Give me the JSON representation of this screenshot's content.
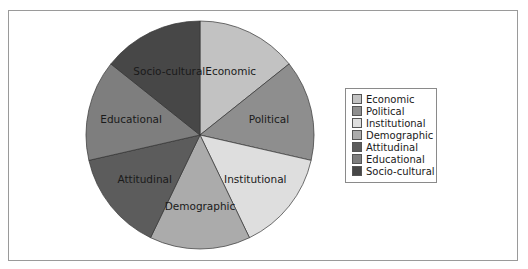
{
  "chart_data": {
    "type": "pie",
    "title": "",
    "categories": [
      "Economic",
      "Political",
      "Institutional",
      "Demographic",
      "Attitudinal",
      "Educational",
      "Socio-cultural"
    ],
    "values": [
      1,
      1,
      1,
      1,
      1,
      1,
      1
    ],
    "colors": [
      "#c2c2c2",
      "#8e8e8e",
      "#dedede",
      "#ababab",
      "#5c5c5c",
      "#7e7e7e",
      "#474747"
    ],
    "start_angle_deg": 0,
    "direction": "clockwise",
    "legend_position": "right",
    "slice_labels": [
      "Economic",
      "Political",
      "Institutional",
      "Demographic",
      "Attitudinal",
      "Educational",
      "Socio-cultural"
    ]
  },
  "legend": {
    "items": [
      {
        "label": "Economic",
        "color": "#c2c2c2"
      },
      {
        "label": "Political",
        "color": "#8e8e8e"
      },
      {
        "label": "Institutional",
        "color": "#dedede"
      },
      {
        "label": "Demographic",
        "color": "#ababab"
      },
      {
        "label": "Attitudinal",
        "color": "#5c5c5c"
      },
      {
        "label": "Educational",
        "color": "#7e7e7e"
      },
      {
        "label": "Socio-cultural",
        "color": "#474747"
      }
    ]
  }
}
